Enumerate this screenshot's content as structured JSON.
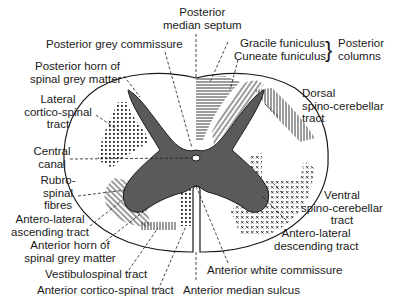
{
  "diagram": {
    "colors": {
      "grey_matter": "#5a5a5a",
      "outline": "#1a1a1a",
      "background": "#ffffff"
    },
    "labels": {
      "posterior_median_septum": [
        "Posterior",
        "median septum"
      ],
      "posterior_grey_commissure": "Posterior grey commissure",
      "gracile_funiculus": "Gracile funiculus",
      "cuneate_funiculus": "Cuneate funiculus",
      "posterior_columns": [
        "Posterior",
        "columns"
      ],
      "posterior_horn": [
        "Posterior horn of",
        "spinal grey matter"
      ],
      "lateral_corticospinal": [
        "Lateral",
        "cortico-spinal",
        "tract"
      ],
      "dorsal_spinocerebellar": [
        "Dorsal",
        "spino-cerebellar",
        "tract"
      ],
      "central_canal": [
        "Central",
        "canal"
      ],
      "rubrospinal": [
        "Rubro-",
        "spinal",
        "fibres"
      ],
      "anterolateral_ascending": [
        "Antero-lateral",
        "ascending tract"
      ],
      "ventral_spinocerebellar": [
        "Ventral",
        "spino-cerebellar",
        "tract"
      ],
      "anterior_horn": [
        "Anterior horn of",
        "spinal grey matter"
      ],
      "anterolateral_descending": [
        "Antero-lateral",
        "descending tract"
      ],
      "vestibulospinal": "Vestibulospinal tract",
      "anterior_white_commissure": "Anterior white commissure",
      "anterior_corticospinal": "Anterior cortico-spinal tract",
      "anterior_median_sulcus": "Anterior median sulcus"
    }
  }
}
